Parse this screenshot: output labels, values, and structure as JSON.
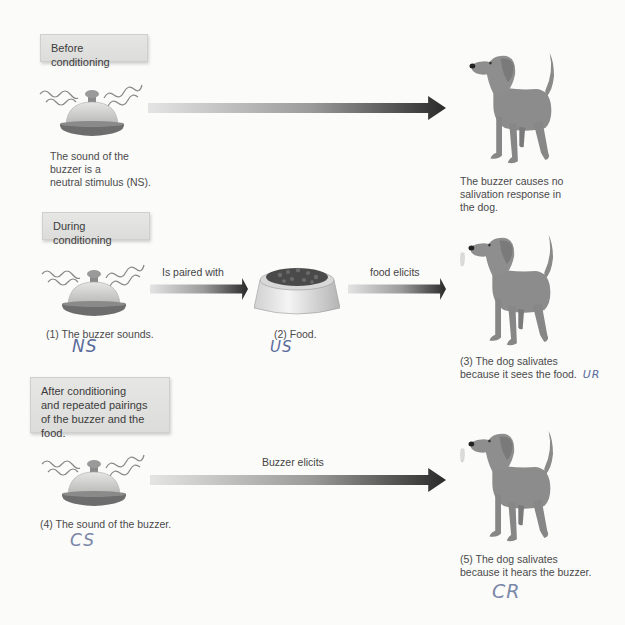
{
  "stages": {
    "before": {
      "title": "Before conditioning",
      "bell_caption": [
        "The sound of the",
        "buzzer is a",
        "neutral stimulus (NS)."
      ],
      "dog_caption": [
        "The buzzer causes no",
        "salivation response in",
        "the dog."
      ]
    },
    "during": {
      "title": "During conditioning",
      "bell_caption": "(1) The buzzer sounds.",
      "bell_annotation": "NS",
      "arrow1_label": "Is paired with",
      "food_caption": "(2) Food.",
      "food_annotation": "US",
      "arrow2_label": "food elicits",
      "dog_caption": [
        "(3) The dog salivates",
        "because it sees the food."
      ],
      "dog_annotation": "UR"
    },
    "after": {
      "title": [
        "After conditioning",
        "and repeated pairings",
        "of the buzzer and the food."
      ],
      "bell_caption": "(4) The sound of the buzzer.",
      "bell_annotation": "CS",
      "arrow_label": "Buzzer elicits",
      "dog_caption": [
        "(5) The dog salivates",
        "because it hears the buzzer."
      ],
      "dog_annotation": "CR"
    }
  },
  "icons": {
    "bell": "service-bell-icon",
    "dog": "dog-illustration",
    "food": "food-bowl-illustration",
    "arrow": "gradient-arrow"
  },
  "colors": {
    "bell_dome": "#cfcfcc",
    "bell_base": "#6b6b6b",
    "dog": "#8a8a8a",
    "arrow_start": "#e2e2e2",
    "arrow_end": "#2a2a2a",
    "box_bg": "#dfdfdd",
    "annotation_ink": "#5a6a9a"
  }
}
